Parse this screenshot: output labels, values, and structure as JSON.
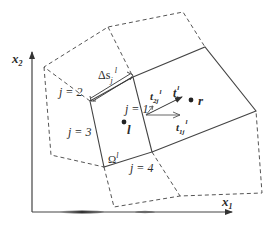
{
  "figure": {
    "type": "finite-volume mesh schematic",
    "axes": {
      "x_label": "x",
      "x_sub": "1",
      "y_label": "x",
      "y_sub": "2"
    },
    "cells": {
      "left": {
        "point_label": "l",
        "region_label": "Ω",
        "region_sup": "l"
      },
      "right": {
        "point_label": "r"
      }
    },
    "faces": [
      {
        "label": "j = 1"
      },
      {
        "label": "j = 2"
      },
      {
        "label": "j = 3"
      },
      {
        "label": "j = 4"
      }
    ],
    "face_length": {
      "label": "Δs",
      "sub": "j",
      "sup": "l"
    },
    "vectors": {
      "normal": {
        "label": "t",
        "sub": "j",
        "sup": "l"
      },
      "tangent1": {
        "label": "t",
        "sub": "1j",
        "sup": "l"
      },
      "tangent2": {
        "label": "t",
        "sub": "2j",
        "sup": "l"
      }
    },
    "colors": {
      "line": "#444444",
      "dashed": "#555555",
      "text": "#2b2b2b"
    }
  }
}
